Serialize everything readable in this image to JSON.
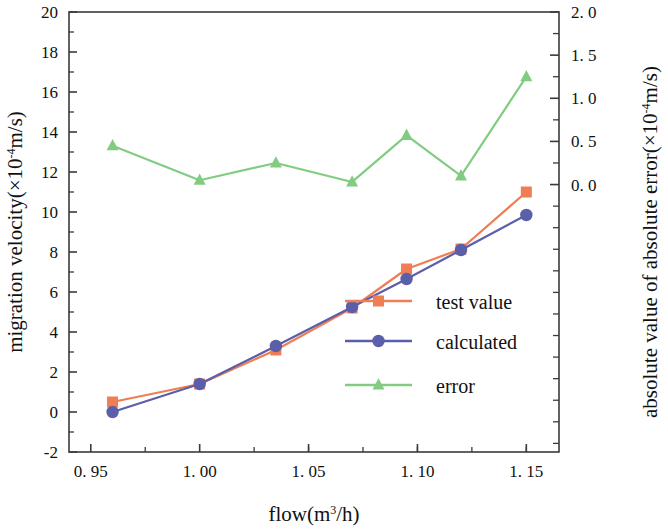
{
  "chart_data": {
    "type": "line",
    "title": "",
    "xlabel": "flow(m³/h)",
    "ylabel": "migration velocity(×10⁻⁴m/s)",
    "y2label": "absolute value of absolute error(×10⁻⁴m/s)",
    "x": [
      0.96,
      1.0,
      1.035,
      1.07,
      1.095,
      1.12,
      1.15
    ],
    "xlim": [
      0.94,
      1.165
    ],
    "ylim": [
      -2,
      20
    ],
    "y2lim": [
      -3.1,
      2.0
    ],
    "xticks": [
      0.95,
      1.0,
      1.05,
      1.1,
      1.15
    ],
    "xticklabels": [
      "0. 95",
      "1. 00",
      "1. 05",
      "1. 10",
      "1. 15"
    ],
    "yticks": [
      -2,
      0,
      2,
      4,
      6,
      8,
      10,
      12,
      14,
      16,
      18,
      20
    ],
    "yticklabels": [
      "-2",
      "0",
      "2",
      "4",
      "6",
      "8",
      "10",
      "12",
      "14",
      "16",
      "18",
      "20"
    ],
    "y2ticks": [
      0.0,
      0.5,
      1.0,
      1.5,
      2.0
    ],
    "y2ticklabels": [
      "0. 0",
      "0. 5",
      "1. 0",
      "1. 5",
      "2. 0"
    ],
    "grid": false,
    "legend_position": "center-right",
    "series": [
      {
        "name": "test value",
        "axis": "left",
        "color": "#ef7e54",
        "marker": "square",
        "values": [
          0.5,
          1.4,
          3.1,
          5.2,
          7.15,
          8.15,
          11.0
        ]
      },
      {
        "name": "calculated",
        "axis": "left",
        "color": "#5b5ea8",
        "marker": "circle",
        "values": [
          0.0,
          1.4,
          3.3,
          5.25,
          6.65,
          8.1,
          9.85
        ]
      },
      {
        "name": "error",
        "axis": "right",
        "color": "#82cc82",
        "marker": "triangle",
        "values": [
          0.45,
          0.05,
          0.25,
          0.03,
          0.57,
          0.1,
          1.25
        ]
      }
    ]
  },
  "legend": {
    "items": [
      {
        "label": "test value"
      },
      {
        "label": "calculated"
      },
      {
        "label": "error"
      }
    ]
  },
  "axes": {
    "x_title_main": "flow(m",
    "x_title_sup": "3",
    "x_title_tail": "/h)",
    "y_title_main": "migration velocity(×10",
    "y_title_sup": "-4",
    "y_title_tail": "m/s)",
    "y2_title_main": "absolute value of absolute error(×10",
    "y2_title_sup": "-4",
    "y2_title_tail": "m/s)"
  }
}
